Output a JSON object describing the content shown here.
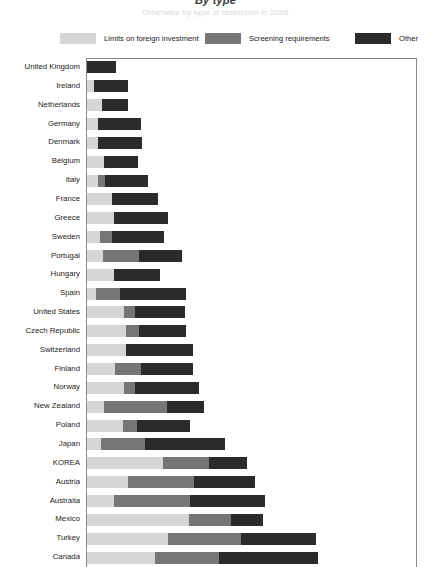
{
  "title": {
    "main": "By type",
    "sub": "Otherwise by type of restriction in 2006"
  },
  "legend": {
    "position": "top",
    "items": [
      {
        "label": "Limits on foreign investment",
        "color": "#d6d6d6",
        "key": "limits"
      },
      {
        "label": "Screening requirements",
        "color": "#767676",
        "key": "screening"
      },
      {
        "label": "Other",
        "color": "#2b2b2b",
        "key": "other"
      }
    ]
  },
  "chart_data": {
    "type": "bar",
    "orientation": "horizontal",
    "stacked": true,
    "title": "By type",
    "subtitle": "Otherwise by type of restriction in 2006",
    "xlabel": "",
    "ylabel": "",
    "grid": false,
    "xlim": [
      0,
      0.46
    ],
    "legend_position": "top",
    "categories": [
      "United Kingdom",
      "Ireland",
      "Netherlands",
      "Germany",
      "Denmark",
      "Belgium",
      "Italy",
      "France",
      "Greece",
      "Sweden",
      "Portugal",
      "Hungary",
      "Spain",
      "United States",
      "Czech Republic",
      "Switzerland",
      "Finland",
      "Norway",
      "New Zealand",
      "Poland",
      "Japan",
      "KOREA",
      "Austria",
      "Australia",
      "Mexico",
      "Turkey",
      "Canada"
    ],
    "series": [
      {
        "name": "Limits on foreign investment",
        "color": "#d6d6d6",
        "values": [
          0.0,
          0.01,
          0.021,
          0.015,
          0.015,
          0.024,
          0.015,
          0.035,
          0.037,
          0.018,
          0.022,
          0.038,
          0.013,
          0.052,
          0.054,
          0.054,
          0.039,
          0.052,
          0.024,
          0.05,
          0.02,
          0.106,
          0.057,
          0.038,
          0.142,
          0.113,
          0.095
        ]
      },
      {
        "name": "Screening requirements",
        "color": "#767676",
        "values": [
          0.0,
          0.0,
          0.0,
          0.0,
          0.0,
          0.0,
          0.01,
          0.0,
          0.0,
          0.017,
          0.05,
          0.0,
          0.033,
          0.015,
          0.018,
          0.0,
          0.036,
          0.015,
          0.087,
          0.02,
          0.061,
          0.063,
          0.092,
          0.105,
          0.058,
          0.101,
          0.089
        ]
      },
      {
        "name": "Other",
        "color": "#2b2b2b",
        "values": [
          0.04,
          0.047,
          0.036,
          0.06,
          0.062,
          0.047,
          0.06,
          0.064,
          0.076,
          0.072,
          0.06,
          0.064,
          0.092,
          0.069,
          0.066,
          0.094,
          0.072,
          0.088,
          0.051,
          0.073,
          0.111,
          0.053,
          0.084,
          0.104,
          0.044,
          0.104,
          0.137
        ]
      }
    ]
  },
  "axis": {
    "plot_left_px": 86,
    "plot_top_px": 58,
    "plot_width_px": 331,
    "plot_height_px": 509
  }
}
